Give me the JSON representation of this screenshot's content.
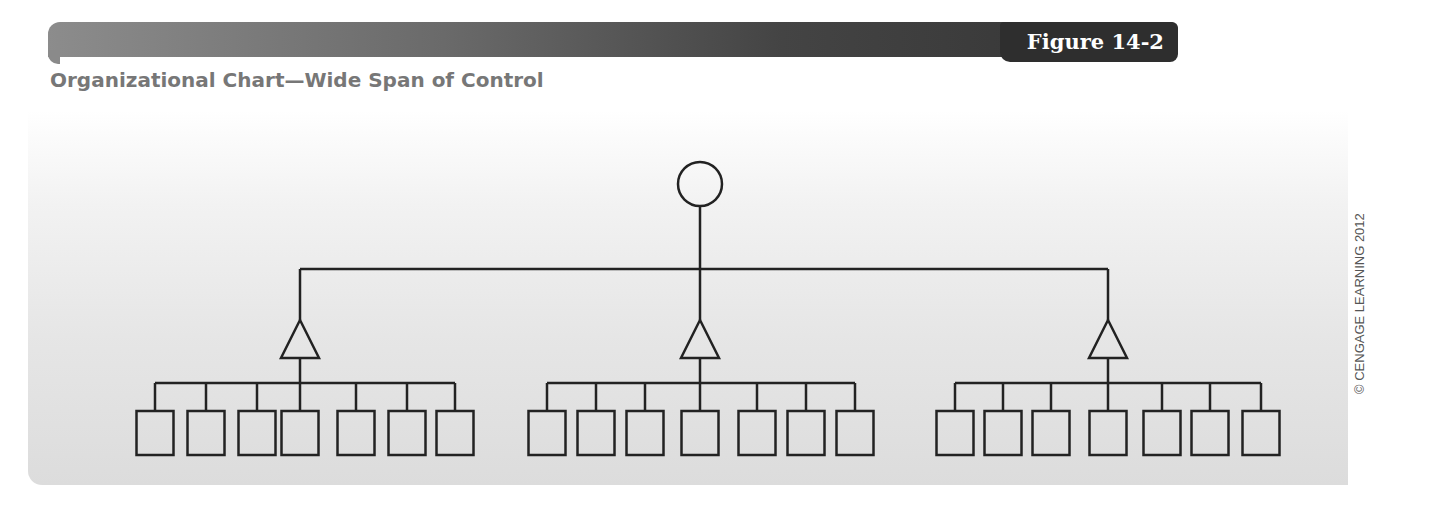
{
  "header": {
    "figure_label": "Figure 14-2",
    "title": "Organizational Chart—Wide Span of Control"
  },
  "copyright": "© CENGAGE LEARNING 2012",
  "colors": {
    "line": "#222222",
    "header_dark": "#2e2e2e",
    "header_light": "#8c8c8c",
    "title": "#777777",
    "panel_top": "#ffffff",
    "panel_bottom": "#dcdcdc"
  },
  "diagram": {
    "type": "org-chart",
    "levels": [
      {
        "level": 1,
        "shape": "circle",
        "count": 1,
        "role": "top executive"
      },
      {
        "level": 2,
        "shape": "triangle",
        "count": 3,
        "role": "middle managers"
      },
      {
        "level": 3,
        "shape": "square",
        "count": 21,
        "per_manager": 7,
        "role": "subordinates"
      }
    ],
    "root": {
      "shape": "circle",
      "cx": 700,
      "cy": 184,
      "r": 22
    },
    "bus_y": 269,
    "managers": [
      {
        "x": 300,
        "boxes": [
          155,
          206,
          257,
          300,
          356,
          407,
          455
        ]
      },
      {
        "x": 700,
        "boxes": [
          547,
          596,
          645,
          700,
          757,
          806,
          855
        ]
      },
      {
        "x": 1108,
        "boxes": [
          955,
          1003,
          1051,
          1108,
          1162,
          1210,
          1261
        ]
      }
    ]
  }
}
